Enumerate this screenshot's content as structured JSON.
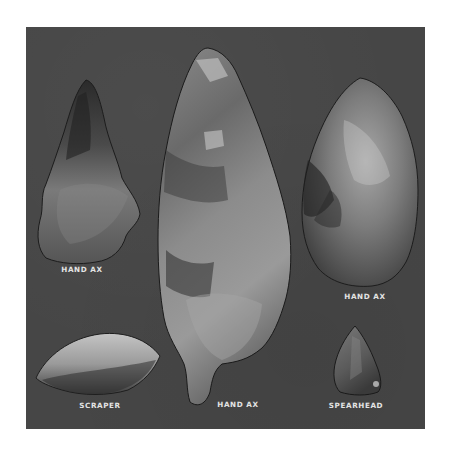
{
  "plate": {
    "background_color": "#464646",
    "artifacts": [
      {
        "id": "hand-ax-left",
        "label": "HAND AX"
      },
      {
        "id": "hand-ax-center",
        "label": "HAND AX"
      },
      {
        "id": "hand-ax-right",
        "label": "HAND AX"
      },
      {
        "id": "scraper",
        "label": "SCRAPER"
      },
      {
        "id": "spearhead",
        "label": "SPEARHEAD"
      }
    ]
  }
}
